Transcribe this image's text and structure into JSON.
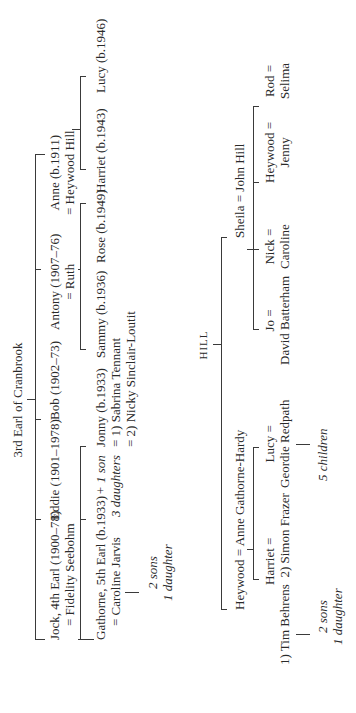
{
  "title": "3rd Earl of Cranbrook",
  "children": [
    {
      "name": "Jock, 4th Earl (1900–78)",
      "spouse": "= Fidelity Seebohm"
    },
    {
      "name": "Eddie (1901–1978)",
      "spouse": ""
    },
    {
      "name": "Bob (1902–73)",
      "spouse": ""
    },
    {
      "name": "Antony (1907–76)",
      "spouse": "= Ruth"
    },
    {
      "name": "Anne (b.1911)",
      "spouse": "= Heywood Hill"
    }
  ],
  "jock_children": {
    "gathorne": {
      "name": "Gathorne, 5th Earl (b.1933)",
      "spouse": "= Caroline Jarvis",
      "issue_1": "2 sons",
      "issue_2": "1 daughter"
    },
    "others": {
      "line1": "+ 1 son",
      "line2": "3 daughters"
    },
    "jonny": {
      "name": "Jonny (b.1933)",
      "spouse1": "= 1) Sabrina Tennant",
      "spouse2": "= 2) Nicky Sinclair-Loutit"
    }
  },
  "antony_children": [
    {
      "name": "Sammy (b.1936)"
    },
    {
      "name": "Rose (b.1949)"
    }
  ],
  "anne_children": [
    {
      "name": "Harriet (b.1943)"
    },
    {
      "name": "Lucy (b.1946)"
    }
  ],
  "hill": {
    "label": "HILL",
    "heywood": {
      "couple": "Heywood = Anne Gathorne-Hardy"
    },
    "heywood_children": [
      {
        "name": "Harriet =",
        "spouse1": "1) Tim Behrens",
        "spouse2": "2) Simon Frazer",
        "issue_1": "2 sons",
        "issue_2": "1 daughter"
      },
      {
        "name": "Lucy =",
        "spouse": "Geordie Redpath",
        "issue": "5 children"
      }
    ],
    "sheila": {
      "couple": "Sheila = John Hill"
    },
    "sheila_children": [
      {
        "name": "Jo =",
        "spouse": "David Batterham"
      },
      {
        "name": "Nick =",
        "spouse": "Caroline"
      },
      {
        "name": "Heywood =",
        "spouse": "Jenny"
      },
      {
        "name": "Rod =",
        "spouse": "Selima"
      }
    ]
  }
}
